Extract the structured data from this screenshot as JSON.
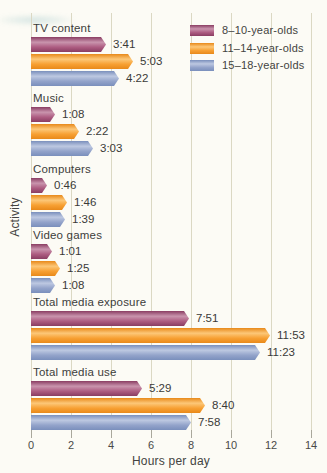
{
  "figure": {
    "xlabel": "Hours per day",
    "ylabel": "Activity"
  },
  "chart_data": {
    "type": "bar",
    "orientation": "horizontal",
    "title": "",
    "xlabel": "Hours per day",
    "ylabel": "Activity",
    "xlim": [
      0,
      14
    ],
    "xticks": [
      0,
      2,
      4,
      6,
      8,
      10,
      12,
      14
    ],
    "grid": true,
    "legend_position": "top-right",
    "categories": [
      "TV content",
      "Music",
      "Computers",
      "Video games",
      "Total media exposure",
      "Total media use"
    ],
    "series": [
      {
        "name": "8–10-year-olds",
        "color": "#ad5c81",
        "color_light": "#c994ad",
        "color_dark": "#8a3d62",
        "values": [
          "3:41",
          "1:08",
          "0:46",
          "1:01",
          "7:51",
          "5:29"
        ]
      },
      {
        "name": "11–14-year-olds",
        "color": "#f7a033",
        "color_light": "#fcc778",
        "color_dark": "#e8891a",
        "values": [
          "5:03",
          "2:22",
          "1:46",
          "1:25",
          "11:53",
          "8:40"
        ]
      },
      {
        "name": "15–18-year-olds",
        "color": "#93a3ca",
        "color_light": "#bdc8e1",
        "color_dark": "#7a8fbc",
        "values": [
          "4:22",
          "3:03",
          "1:39",
          "1:08",
          "11:23",
          "7:58"
        ]
      }
    ],
    "colors": {
      "gridline": "#dbd8c3",
      "tick": "#a9a89c",
      "text": "#3d3d3b",
      "background": "#fcfbf5"
    }
  }
}
